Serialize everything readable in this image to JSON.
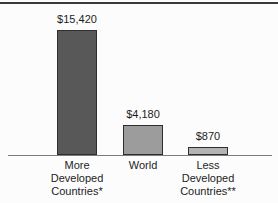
{
  "page": {
    "background": "#fcfcfc",
    "top_rule_color": "#3a3a3a",
    "axis_line_color": "#7d7d7d",
    "text_color": "#1c1c1c"
  },
  "chart_data": {
    "type": "bar",
    "title": "",
    "xlabel": "",
    "ylabel": "",
    "categories": [
      "More Developed Countries*",
      "World",
      "Less Developed Countries**"
    ],
    "category_lines": [
      [
        "More",
        "Developed",
        "Countries*"
      ],
      [
        "World"
      ],
      [
        "Less",
        "Developed",
        "Countries**"
      ]
    ],
    "values": [
      15420,
      4180,
      870
    ],
    "value_labels": [
      "$15,420",
      "$4,180",
      "$870"
    ],
    "bar_colors": [
      "#585858",
      "#9c9c9c",
      "#b3b3b3"
    ],
    "bar_border_color": "#2e2e2e",
    "ylim": [
      0,
      15420
    ],
    "grid": false,
    "legend": false,
    "layout": {
      "baseline_y_px": 155,
      "bar_width_px": 40,
      "centers_px": [
        77,
        143,
        208
      ],
      "heights_px": [
        125,
        30,
        8
      ],
      "value_label_gap_px": 17,
      "category_top_gap_px": 4
    }
  }
}
